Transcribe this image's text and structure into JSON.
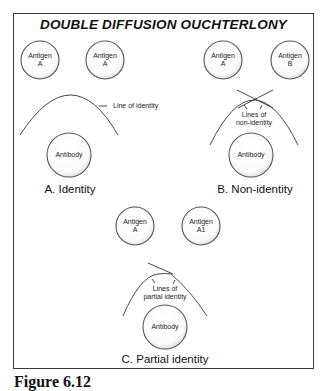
{
  "title": "DOUBLE DIFFUSION OUCHTERLONY",
  "panels": {
    "a": {
      "label": "A.  Identity",
      "antigen_left": {
        "line1": "Antigen",
        "line2": "A"
      },
      "antigen_right": {
        "line1": "Antigen",
        "line2": "A"
      },
      "antibody": "Antibody",
      "annotation": "Line of identity"
    },
    "b": {
      "label": "B.  Non-identity",
      "antigen_left": {
        "line1": "Antigen",
        "line2": "A"
      },
      "antigen_right": {
        "line1": "Antigen",
        "line2": "B"
      },
      "antibody": "Antibody",
      "annotation": {
        "line1": "Lines of",
        "line2": "non-identity"
      }
    },
    "c": {
      "label": "C. Partial identity",
      "antigen_left": {
        "line1": "Antigen",
        "line2": "A"
      },
      "antigen_right": {
        "line1": "Antigen",
        "line2": "A1"
      },
      "antibody": "Antibody",
      "annotation": {
        "line1": "Lines of",
        "line2": "partial identity"
      }
    }
  },
  "caption": "Figure 6.12",
  "colors": {
    "stroke": "#333333",
    "well_fill": "#ffffff",
    "well_shadow": "#9a9a9a"
  }
}
